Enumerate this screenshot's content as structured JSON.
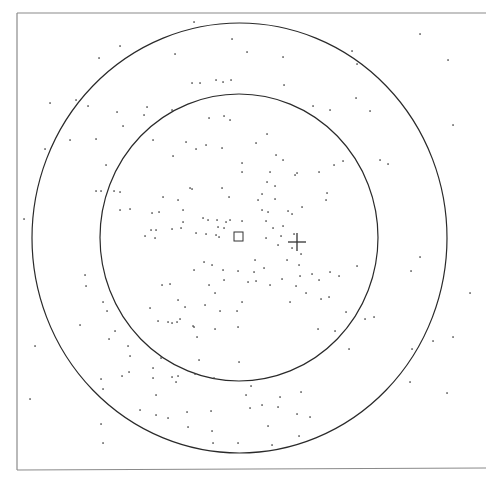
{
  "figure": {
    "frame": {
      "left": 17,
      "top": 13,
      "right": 486,
      "bottom": 470,
      "color": "#8a8a8a"
    },
    "outer_ring": {
      "cx": 239.5,
      "cy": 238,
      "rx": 207.5,
      "ry": 215,
      "color": "#2a2a2a"
    },
    "inner_ring": {
      "cx": 239,
      "cy": 237.5,
      "rx": 139,
      "ry": 143.5,
      "color": "#2a2a2a"
    },
    "square_marker": {
      "x": 234,
      "y": 232,
      "size": 9,
      "color": "#333333"
    },
    "cross_marker": {
      "x": 297,
      "y": 242,
      "arm": 9,
      "color": "#333333"
    },
    "point_color": "#444444",
    "points": [
      [
        194,
        22
      ],
      [
        120,
        46
      ],
      [
        232,
        39
      ],
      [
        99,
        58
      ],
      [
        175,
        54
      ],
      [
        223,
        82
      ],
      [
        192,
        83
      ],
      [
        200,
        83
      ],
      [
        216,
        80
      ],
      [
        231,
        80
      ],
      [
        50,
        103
      ],
      [
        76,
        100
      ],
      [
        88,
        106
      ],
      [
        117,
        112
      ],
      [
        147,
        107
      ],
      [
        172,
        110
      ],
      [
        123,
        126
      ],
      [
        144,
        115
      ],
      [
        209,
        118
      ],
      [
        224,
        116
      ],
      [
        230,
        120
      ],
      [
        45,
        149
      ],
      [
        70,
        140
      ],
      [
        96,
        139
      ],
      [
        153,
        140
      ],
      [
        186,
        142
      ],
      [
        196,
        149
      ],
      [
        206,
        145
      ],
      [
        222,
        148
      ],
      [
        173,
        156
      ],
      [
        106,
        165
      ],
      [
        242,
        163
      ],
      [
        242,
        172
      ],
      [
        96,
        191
      ],
      [
        101,
        191
      ],
      [
        114,
        191
      ],
      [
        120,
        192
      ],
      [
        190,
        188
      ],
      [
        222,
        188
      ],
      [
        163,
        197
      ],
      [
        178,
        200
      ],
      [
        192,
        189
      ],
      [
        229,
        197
      ],
      [
        120,
        210
      ],
      [
        130,
        209
      ],
      [
        152,
        213
      ],
      [
        159,
        212
      ],
      [
        183,
        210
      ],
      [
        183,
        222
      ],
      [
        203,
        218
      ],
      [
        208,
        220
      ],
      [
        217,
        220
      ],
      [
        226,
        222
      ],
      [
        224,
        228
      ],
      [
        218,
        227
      ],
      [
        230,
        220
      ],
      [
        242,
        221
      ],
      [
        151,
        230
      ],
      [
        156,
        230
      ],
      [
        172,
        229
      ],
      [
        181,
        228
      ],
      [
        145,
        236
      ],
      [
        155,
        238
      ],
      [
        196,
        233
      ],
      [
        206,
        234
      ],
      [
        216,
        235
      ],
      [
        219,
        237
      ],
      [
        24,
        219
      ],
      [
        262,
        210
      ],
      [
        268,
        212
      ],
      [
        283,
        226
      ],
      [
        288,
        211
      ],
      [
        266,
        221
      ],
      [
        273,
        228
      ],
      [
        294,
        234
      ],
      [
        281,
        236
      ],
      [
        266,
        238
      ],
      [
        278,
        245
      ],
      [
        292,
        248
      ],
      [
        301,
        254
      ],
      [
        247,
        52
      ],
      [
        283,
        57
      ],
      [
        284,
        85
      ],
      [
        352,
        51
      ],
      [
        357,
        64
      ],
      [
        313,
        106
      ],
      [
        356,
        98
      ],
      [
        330,
        110
      ],
      [
        370,
        111
      ],
      [
        420,
        34
      ],
      [
        448,
        60
      ],
      [
        453,
        125
      ],
      [
        256,
        143
      ],
      [
        267,
        134
      ],
      [
        276,
        155
      ],
      [
        283,
        160
      ],
      [
        297,
        173
      ],
      [
        270,
        172
      ],
      [
        295,
        175
      ],
      [
        319,
        172
      ],
      [
        267,
        182
      ],
      [
        275,
        186
      ],
      [
        262,
        194
      ],
      [
        275,
        199
      ],
      [
        258,
        200
      ],
      [
        292,
        214
      ],
      [
        302,
        207
      ],
      [
        327,
        193
      ],
      [
        326,
        200
      ],
      [
        334,
        165
      ],
      [
        343,
        161
      ],
      [
        380,
        160
      ],
      [
        388,
        164
      ],
      [
        299,
        265
      ],
      [
        312,
        274
      ],
      [
        300,
        276
      ],
      [
        319,
        280
      ],
      [
        330,
        272
      ],
      [
        264,
        268
      ],
      [
        282,
        279
      ],
      [
        287,
        260
      ],
      [
        255,
        260
      ],
      [
        256,
        281
      ],
      [
        270,
        285
      ],
      [
        296,
        286
      ],
      [
        306,
        293
      ],
      [
        321,
        299
      ],
      [
        329,
        297
      ],
      [
        339,
        276
      ],
      [
        290,
        302
      ],
      [
        242,
        302
      ],
      [
        248,
        282
      ],
      [
        318,
        329
      ],
      [
        335,
        331
      ],
      [
        254,
        272
      ],
      [
        346,
        312
      ],
      [
        365,
        319
      ],
      [
        349,
        349
      ],
      [
        357,
        266
      ],
      [
        374,
        317
      ],
      [
        420,
        257
      ],
      [
        470,
        293
      ],
      [
        433,
        341
      ],
      [
        453,
        337
      ],
      [
        411,
        271
      ],
      [
        412,
        349
      ],
      [
        410,
        382
      ],
      [
        447,
        393
      ],
      [
        278,
        407
      ],
      [
        297,
        414
      ],
      [
        262,
        405
      ],
      [
        301,
        392
      ],
      [
        310,
        417
      ],
      [
        299,
        436
      ],
      [
        238,
        443
      ],
      [
        85,
        275
      ],
      [
        86,
        286
      ],
      [
        80,
        325
      ],
      [
        103,
        302
      ],
      [
        107,
        311
      ],
      [
        115,
        331
      ],
      [
        109,
        339
      ],
      [
        128,
        346
      ],
      [
        130,
        356
      ],
      [
        150,
        308
      ],
      [
        158,
        321
      ],
      [
        168,
        322
      ],
      [
        172,
        323
      ],
      [
        177,
        322
      ],
      [
        180,
        319
      ],
      [
        185,
        307
      ],
      [
        193,
        326
      ],
      [
        194,
        327
      ],
      [
        197,
        337
      ],
      [
        205,
        305
      ],
      [
        215,
        329
      ],
      [
        220,
        311
      ],
      [
        237,
        311
      ],
      [
        238,
        327
      ],
      [
        162,
        285
      ],
      [
        170,
        284
      ],
      [
        178,
        300
      ],
      [
        194,
        270
      ],
      [
        204,
        262
      ],
      [
        212,
        265
      ],
      [
        223,
        270
      ],
      [
        224,
        280
      ],
      [
        238,
        271
      ],
      [
        209,
        285
      ],
      [
        215,
        293
      ],
      [
        161,
        358
      ],
      [
        153,
        368
      ],
      [
        176,
        382
      ],
      [
        178,
        376
      ],
      [
        199,
        360
      ],
      [
        195,
        374
      ],
      [
        214,
        378
      ],
      [
        239,
        362
      ],
      [
        35,
        346
      ],
      [
        30,
        399
      ],
      [
        101,
        379
      ],
      [
        103,
        389
      ],
      [
        122,
        376
      ],
      [
        129,
        372
      ],
      [
        153,
        378
      ],
      [
        172,
        377
      ],
      [
        156,
        395
      ],
      [
        140,
        410
      ],
      [
        156,
        415
      ],
      [
        168,
        418
      ],
      [
        187,
        412
      ],
      [
        211,
        411
      ],
      [
        212,
        431
      ],
      [
        188,
        427
      ],
      [
        101,
        424
      ],
      [
        103,
        443
      ],
      [
        213,
        443
      ],
      [
        250,
        408
      ],
      [
        246,
        395
      ],
      [
        268,
        426
      ],
      [
        251,
        386
      ],
      [
        280,
        397
      ],
      [
        272,
        445
      ]
    ]
  }
}
